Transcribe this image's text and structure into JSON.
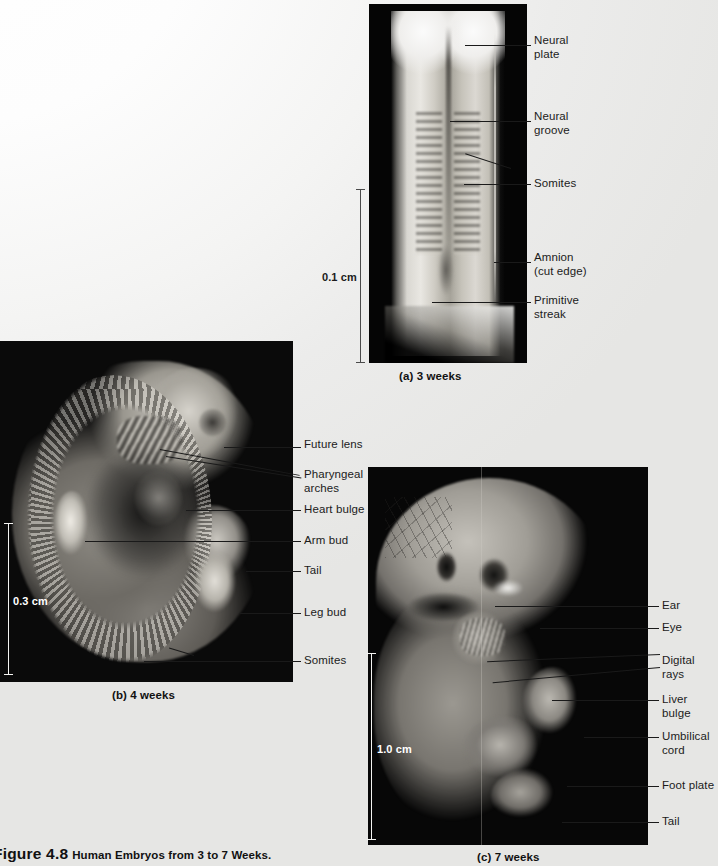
{
  "figure": {
    "number": "Figure 4.8",
    "title": "Human Embryos from 3 to 7 Weeks."
  },
  "panels": [
    {
      "id": "a",
      "caption": "(a) 3 weeks",
      "scale": "0.1 cm",
      "labels": [
        {
          "text": "Neural\nplate"
        },
        {
          "text": "Neural\ngroove"
        },
        {
          "text": "Somites"
        },
        {
          "text": "Amnion\n(cut edge)"
        },
        {
          "text": "Primitive\nstreak"
        }
      ]
    },
    {
      "id": "b",
      "caption": "(b) 4 weeks",
      "scale": "0.3 cm",
      "labels": [
        {
          "text": "Future lens"
        },
        {
          "text": "Pharyngeal\narches"
        },
        {
          "text": "Heart bulge"
        },
        {
          "text": "Arm bud"
        },
        {
          "text": "Tail"
        },
        {
          "text": "Leg bud"
        },
        {
          "text": "Somites"
        }
      ]
    },
    {
      "id": "c",
      "caption": "(c) 7 weeks",
      "scale": "1.0 cm",
      "labels": [
        {
          "text": "Ear"
        },
        {
          "text": "Eye"
        },
        {
          "text": "Digital rays"
        },
        {
          "text": "Liver bulge"
        },
        {
          "text": "Umbilical\ncord"
        },
        {
          "text": "Foot plate"
        },
        {
          "text": "Tail"
        }
      ]
    }
  ]
}
